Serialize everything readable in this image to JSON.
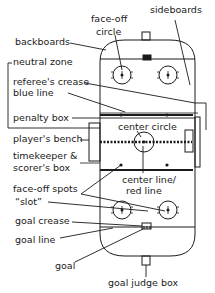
{
  "diagram": {
    "colors": {
      "ink": "#1a1a1a",
      "background": "#ffffff"
    },
    "labels": {
      "face_off_circle_1": "face-off",
      "face_off_circle_2": "circle",
      "sideboards": "sideboards",
      "backboards": "backboards",
      "neutral_zone": "neutral zone",
      "referees_crease": "referee's crease",
      "blue_line": "blue line",
      "penalty_box": "penalty box",
      "players_bench": "player's bench",
      "center_circle": "center circle",
      "timekeeper_1": "timekeeper &",
      "timekeeper_2": "scorer's box",
      "center_line_1": "center line/",
      "center_line_2": "red line",
      "face_off_spots": "face-off spots",
      "slot": "“slot”",
      "goal_crease": "goal crease",
      "goal_line": "goal line",
      "goal": "goal",
      "goal_judge_box": "goal judge box"
    }
  }
}
